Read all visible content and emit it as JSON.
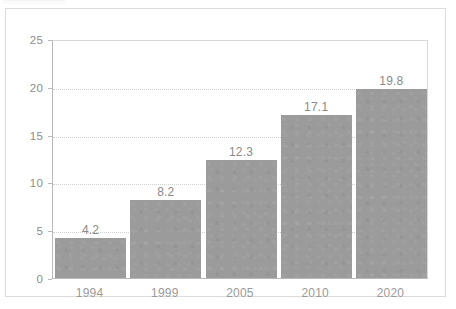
{
  "chart_data": {
    "type": "bar",
    "title": "",
    "subtitle": "",
    "xlabel": "",
    "ylabel": "",
    "categories": [
      "1994",
      "1999",
      "2005",
      "2010",
      "2020"
    ],
    "values": [
      4.2,
      8.2,
      12.3,
      17.1,
      19.8
    ],
    "value_labels": [
      "4.2",
      "8.2",
      "12.3",
      "17.1",
      "19.8"
    ],
    "ylim": [
      0,
      25
    ],
    "yticks": [
      0,
      5,
      10,
      15,
      20,
      25
    ],
    "ytick_labels": [
      "0",
      "5",
      "10",
      "15",
      "20",
      "25"
    ],
    "grid": true,
    "grid_style": "dotted horizontal",
    "legend": null,
    "series": [
      {
        "name": "",
        "values": [
          4.2,
          8.2,
          12.3,
          17.1,
          19.8
        ],
        "color": "#9b9b9b"
      }
    ]
  },
  "colors": {
    "bar_fill": "#9b9b9b",
    "grid": "#cfcfcf",
    "axis": "#b9b9b9",
    "card_border": "#dcdcdc",
    "tick_text": "#8d8d8d",
    "value_text": "#8a8a8a",
    "background": "#ffffff"
  }
}
